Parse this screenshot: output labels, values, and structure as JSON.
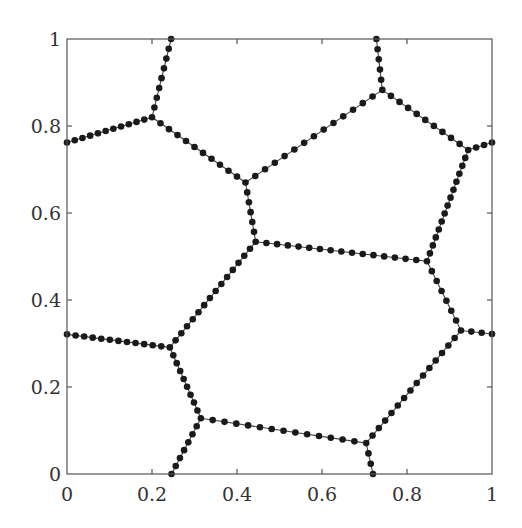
{
  "chart_data": {
    "type": "line",
    "title": "",
    "xlabel": "",
    "ylabel": "",
    "xlim": [
      0,
      1
    ],
    "ylim": [
      0,
      1
    ],
    "grid": false,
    "legend": null,
    "x_ticks": [
      0,
      0.2,
      0.4,
      0.6,
      0.8,
      1
    ],
    "x_tick_labels": [
      "0",
      "0.2",
      "0.4",
      "0.6",
      "0.8",
      "1"
    ],
    "y_ticks": [
      0,
      0.2,
      0.4,
      0.6,
      0.8,
      1
    ],
    "y_tick_labels": [
      "0",
      "0.2",
      "0.4",
      "0.6",
      "0.8",
      "1"
    ],
    "marker": "filled-circle",
    "vertices": {
      "A": [
        0.2,
        0.82
      ],
      "B": [
        0.42,
        0.67
      ],
      "C": [
        0.742,
        0.883
      ],
      "D": [
        0.944,
        0.745
      ],
      "E": [
        0.444,
        0.534
      ],
      "F": [
        0.847,
        0.489
      ],
      "G": [
        0.242,
        0.291
      ],
      "H": [
        0.927,
        0.33
      ],
      "I": [
        0.315,
        0.128
      ],
      "J": [
        0.704,
        0.071
      ]
    },
    "segments": [
      {
        "from": [
          0.245,
          1.0
        ],
        "to": [
          0.2,
          0.82
        ],
        "dots": 8
      },
      {
        "from": [
          0.0,
          0.762
        ],
        "to": [
          0.2,
          0.82
        ],
        "dots": 11
      },
      {
        "from": [
          0.2,
          0.82
        ],
        "to": [
          0.42,
          0.67
        ],
        "dots": 11
      },
      {
        "from": [
          0.42,
          0.67
        ],
        "to": [
          0.742,
          0.883
        ],
        "dots": 14
      },
      {
        "from": [
          0.728,
          1.0
        ],
        "to": [
          0.742,
          0.883
        ],
        "dots": 5
      },
      {
        "from": [
          0.742,
          0.883
        ],
        "to": [
          0.944,
          0.745
        ],
        "dots": 10
      },
      {
        "from": [
          0.944,
          0.745
        ],
        "to": [
          1.0,
          0.762
        ],
        "dots": 3
      },
      {
        "from": [
          0.42,
          0.67
        ],
        "to": [
          0.444,
          0.534
        ],
        "dots": 6
      },
      {
        "from": [
          0.444,
          0.534
        ],
        "to": [
          0.847,
          0.489
        ],
        "dots": 16
      },
      {
        "from": [
          0.944,
          0.745
        ],
        "to": [
          0.847,
          0.489
        ],
        "dots": 14
      },
      {
        "from": [
          0.444,
          0.534
        ],
        "to": [
          0.242,
          0.291
        ],
        "dots": 15
      },
      {
        "from": [
          0.0,
          0.321
        ],
        "to": [
          0.242,
          0.291
        ],
        "dots": 12
      },
      {
        "from": [
          0.847,
          0.489
        ],
        "to": [
          0.927,
          0.33
        ],
        "dots": 7
      },
      {
        "from": [
          0.927,
          0.33
        ],
        "to": [
          1.0,
          0.322
        ],
        "dots": 3
      },
      {
        "from": [
          0.242,
          0.291
        ],
        "to": [
          0.315,
          0.128
        ],
        "dots": 9
      },
      {
        "from": [
          0.315,
          0.128
        ],
        "to": [
          0.246,
          0.0
        ],
        "dots": 7
      },
      {
        "from": [
          0.315,
          0.128
        ],
        "to": [
          0.704,
          0.071
        ],
        "dots": 14
      },
      {
        "from": [
          0.704,
          0.071
        ],
        "to": [
          0.927,
          0.33
        ],
        "dots": 15
      },
      {
        "from": [
          0.704,
          0.071
        ],
        "to": [
          0.72,
          0.0
        ],
        "dots": 3
      }
    ]
  },
  "colors": {
    "line": "#444444",
    "marker": "#1a1a1a",
    "axis": "#555555",
    "text": "#333333",
    "background": "#ffffff"
  }
}
